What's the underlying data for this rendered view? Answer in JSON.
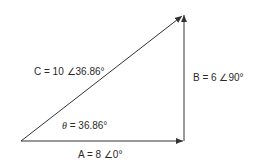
{
  "diagram": {
    "type": "phasor-triangle",
    "colors": {
      "line": "#333333",
      "text": "#2a2a2a",
      "background": "#ffffff"
    },
    "vectors": {
      "A": {
        "label": "A = 8 ∠0°",
        "magnitude": 8,
        "angle_deg": 0
      },
      "B": {
        "label": "B = 6 ∠90°",
        "magnitude": 6,
        "angle_deg": 90
      },
      "C": {
        "label": "C = 10 ∠36.86°",
        "magnitude": 10,
        "angle_deg": 36.86
      }
    },
    "angle": {
      "symbol": "θ",
      "rest": " = 36.86°",
      "value_deg": 36.86
    }
  }
}
